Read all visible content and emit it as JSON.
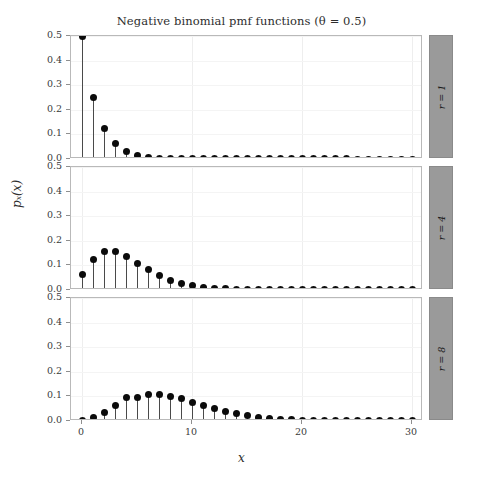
{
  "chart_data": {
    "type": "scatter",
    "plot_style": "stem-lollipop-faceted",
    "title": "Negative binomial pmf functions (θ = 0.5)",
    "xlabel": "x",
    "ylabel": "pₓ(x)",
    "theta": 0.5,
    "xlim": [
      -1,
      31
    ],
    "ylim": [
      0.0,
      0.5
    ],
    "grid": true,
    "legend": "none",
    "facet_position": "right-strip",
    "x_ticks": [
      0,
      10,
      20,
      30
    ],
    "x_tick_labels": [
      "0",
      "10",
      "20",
      "30"
    ],
    "y_ticks": [
      0.0,
      0.1,
      0.2,
      0.3,
      0.4,
      0.5
    ],
    "y_tick_labels": [
      "0.0",
      "0.1",
      "0.2",
      "0.3",
      "0.4",
      "0.5"
    ],
    "x": [
      0,
      1,
      2,
      3,
      4,
      5,
      6,
      7,
      8,
      9,
      10,
      11,
      12,
      13,
      14,
      15,
      16,
      17,
      18,
      19,
      20,
      21,
      22,
      23,
      24,
      25,
      26,
      27,
      28,
      29,
      30
    ],
    "panels": [
      {
        "strip_label": "r = 1",
        "r": 1,
        "values": [
          0.5,
          0.25,
          0.125,
          0.0625,
          0.03125,
          0.015625,
          0.0078125,
          0.00390625,
          0.001953125,
          0.000976563,
          0.000488281,
          0.000244141,
          0.00012207,
          6.1035e-05,
          3.0518e-05,
          1.5259e-05,
          7.629e-06,
          3.815e-06,
          1.907e-06,
          9.54e-07,
          4.77e-07,
          2.38e-07,
          1.19e-07,
          6e-08,
          3e-08,
          1.5e-08,
          7e-09,
          4e-09,
          2e-09,
          1e-09,
          5e-10
        ]
      },
      {
        "strip_label": "r = 4",
        "r": 4,
        "values": [
          0.0625,
          0.125,
          0.15625,
          0.15625,
          0.13671875,
          0.109375,
          0.08203125,
          0.05859375,
          0.040283203,
          0.026916504,
          0.017547607,
          0.011219025,
          0.007045746,
          0.004359245,
          0.002664566,
          0.001610816,
          0.000964403,
          0.000572443,
          0.000337183,
          0.000197194,
          0.000114596,
          6.6229e-05,
          3.808e-05,
          2.1793e-05,
          1.2422e-05,
          7.053e-06,
          3.989e-06,
          2.249e-06,
          1.264e-06,
          7.08e-07,
          3.96e-07
        ]
      },
      {
        "strip_label": "r = 8",
        "r": 8,
        "values": [
          0.00390625,
          0.015625,
          0.03515625,
          0.0625,
          0.09375,
          0.09375,
          0.10742188,
          0.10742188,
          0.10073853,
          0.08956314,
          0.07608867,
          0.0623471,
          0.04935646,
          0.0379742,
          0.02848065,
          0.02088581,
          0.01501168,
          0.01059648,
          0.00735867,
          0.00503383,
          0.00339784,
          0.00226523,
          0.00149299,
          0.00097369,
          0.00062902,
          0.00040273,
          0.00025575,
          0.00016117,
          0.00010084,
          6.267e-05,
          3.871e-05
        ]
      }
    ]
  }
}
